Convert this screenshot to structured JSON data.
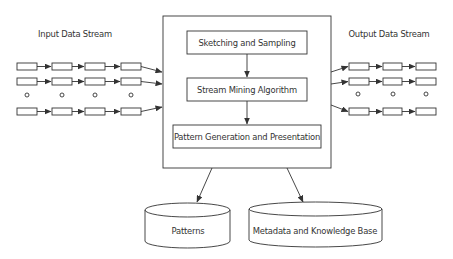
{
  "input_stream": {
    "title": "Input Data Stream",
    "rows": 3,
    "boxes_per_row": 4,
    "ellipsis": "o"
  },
  "output_stream": {
    "title": "Output Data Stream",
    "rows": 3,
    "boxes_per_row": 3,
    "ellipsis": "o"
  },
  "system": {
    "steps": [
      {
        "label": "Sketching and Sampling"
      },
      {
        "label": "Stream Mining Algorithm"
      },
      {
        "label": "Pattern Generation and Presentation"
      }
    ]
  },
  "stores": [
    {
      "label": "Patterns"
    },
    {
      "label": "Metadata and Knowledge Base"
    }
  ],
  "colors": {
    "stroke": "#333333",
    "background": "#ffffff"
  }
}
